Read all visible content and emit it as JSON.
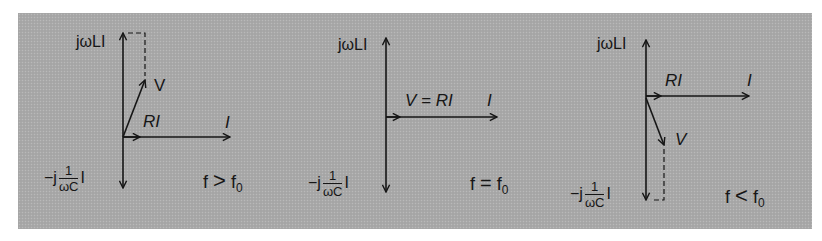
{
  "figure": {
    "background_color": "#a9a9a9",
    "ink_color": "#161616",
    "panels": [
      {
        "id": "above-resonance",
        "labels": {
          "inductive": "jωLI",
          "capacitive_prefix": "−j",
          "capacitive_num": "1",
          "capacitive_den": "ωC",
          "capacitive_suffix": "I",
          "voltage": "V",
          "resistive": "RI",
          "current": "I",
          "condition_lhs": "f",
          "condition_op": ">",
          "condition_rhs": "f",
          "condition_sub": "0"
        }
      },
      {
        "id": "at-resonance",
        "labels": {
          "inductive": "jωLI",
          "capacitive_prefix": "−j",
          "capacitive_num": "1",
          "capacitive_den": "ωC",
          "capacitive_suffix": "I",
          "voltage": "V = RI",
          "current": "I",
          "condition_lhs": "f",
          "condition_op": "=",
          "condition_rhs": "f",
          "condition_sub": "0"
        }
      },
      {
        "id": "below-resonance",
        "labels": {
          "inductive": "jωLI",
          "capacitive_prefix": "−j",
          "capacitive_num": "1",
          "capacitive_den": "ωC",
          "capacitive_suffix": "I",
          "voltage": "V",
          "resistive": "RI",
          "current": "I",
          "condition_lhs": "f",
          "condition_op": "<",
          "condition_rhs": "f",
          "condition_sub": "0"
        }
      }
    ]
  }
}
